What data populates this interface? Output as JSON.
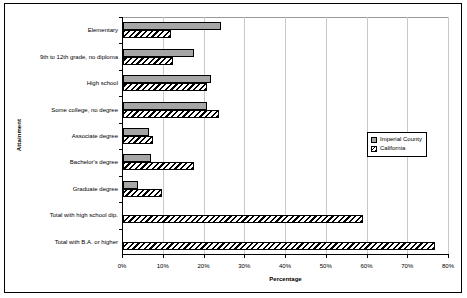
{
  "chart_data": {
    "type": "bar",
    "orientation": "horizontal",
    "title": "",
    "xlabel": "Percentage",
    "ylabel": "Attainment",
    "xlim": [
      0,
      80
    ],
    "xtick_labels": [
      "0%",
      "10%",
      "20%",
      "30%",
      "40%",
      "50%",
      "60%",
      "70%",
      "80%"
    ],
    "xticks": [
      0,
      10,
      20,
      30,
      40,
      50,
      60,
      70,
      80
    ],
    "grid": true,
    "legend_position": "right-middle",
    "categories": [
      "Elementary",
      "9th to 12th grade, no diploma",
      "High school",
      "Some college, no degree",
      "Associate degree",
      "Bachelor's degree",
      "Graduate degree",
      "Total with high school dip.",
      "Total with B.A. or higher"
    ],
    "series": [
      {
        "name": "Imperial County",
        "color": "#a6a6a6",
        "pattern": "solid-gray",
        "values": [
          24.1,
          17.5,
          21.6,
          20.5,
          6.3,
          6.9,
          3.6,
          null,
          null
        ]
      },
      {
        "name": "California",
        "color": "#ffffff",
        "pattern": "diagonal-hatch",
        "values": [
          11.8,
          12.2,
          20.5,
          23.5,
          7.3,
          17.4,
          9.5,
          59.0,
          76.5
        ]
      }
    ]
  },
  "legend": {
    "items": [
      {
        "label": "Imperial County",
        "swatch": "gray-square-icon"
      },
      {
        "label": "California",
        "swatch": "hatched-square-icon"
      }
    ]
  }
}
